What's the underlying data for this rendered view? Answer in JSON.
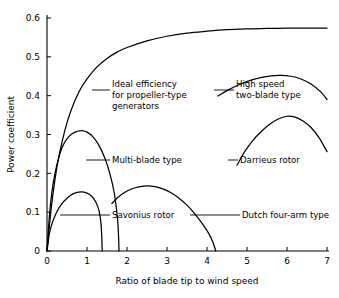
{
  "chart_data": {
    "type": "line",
    "title": "",
    "xlabel": "Ratio of blade tip to wind speed",
    "ylabel": "Power coefficient",
    "xlim": [
      0,
      7
    ],
    "ylim": [
      0,
      0.6
    ],
    "xticks": [
      "0",
      "1",
      "2",
      "3",
      "4",
      "5",
      "6",
      "7"
    ],
    "yticks": [
      "0",
      "0.1",
      "0.2",
      "0.3",
      "0.4",
      "0.5",
      "0.6"
    ],
    "grid": false,
    "legend_position": "inline-annotations",
    "line_color": "#000000",
    "background_color": "#ffffff",
    "series": [
      {
        "name": "Ideal efficiency for propeller-type generators",
        "peak_value": 0.593,
        "points": [
          [
            0.0,
            0.0
          ],
          [
            0.1,
            0.105
          ],
          [
            0.2,
            0.185
          ],
          [
            0.3,
            0.245
          ],
          [
            0.45,
            0.312
          ],
          [
            0.6,
            0.362
          ],
          [
            0.8,
            0.41
          ],
          [
            1.0,
            0.443
          ],
          [
            1.25,
            0.474
          ],
          [
            1.5,
            0.496
          ],
          [
            1.75,
            0.512
          ],
          [
            2.0,
            0.524
          ],
          [
            2.5,
            0.541
          ],
          [
            3.0,
            0.553
          ],
          [
            3.5,
            0.561
          ],
          [
            4.0,
            0.566
          ],
          [
            4.5,
            0.57
          ],
          [
            5.0,
            0.572
          ],
          [
            5.5,
            0.573
          ],
          [
            6.0,
            0.574
          ],
          [
            6.5,
            0.574
          ],
          [
            7.0,
            0.574
          ]
        ]
      },
      {
        "name": "Multi-blade type",
        "peak_value": 0.31,
        "peak_x": 0.87,
        "points": [
          [
            0.0,
            0.0
          ],
          [
            0.06,
            0.09
          ],
          [
            0.12,
            0.15
          ],
          [
            0.2,
            0.2
          ],
          [
            0.3,
            0.243
          ],
          [
            0.4,
            0.272
          ],
          [
            0.55,
            0.295
          ],
          [
            0.7,
            0.306
          ],
          [
            0.87,
            0.31
          ],
          [
            1.0,
            0.306
          ],
          [
            1.15,
            0.294
          ],
          [
            1.3,
            0.272
          ],
          [
            1.45,
            0.238
          ],
          [
            1.58,
            0.196
          ],
          [
            1.68,
            0.15
          ],
          [
            1.74,
            0.105
          ],
          [
            1.78,
            0.06
          ],
          [
            1.8,
            0.0
          ]
        ]
      },
      {
        "name": "Savonius rotor",
        "peak_value": 0.152,
        "peak_x": 0.85,
        "points": [
          [
            0.0,
            0.0
          ],
          [
            0.06,
            0.045
          ],
          [
            0.14,
            0.075
          ],
          [
            0.24,
            0.1
          ],
          [
            0.36,
            0.12
          ],
          [
            0.5,
            0.136
          ],
          [
            0.65,
            0.147
          ],
          [
            0.85,
            0.152
          ],
          [
            1.0,
            0.149
          ],
          [
            1.12,
            0.141
          ],
          [
            1.22,
            0.126
          ],
          [
            1.3,
            0.104
          ],
          [
            1.35,
            0.07
          ],
          [
            1.37,
            0.035
          ],
          [
            1.38,
            0.0
          ]
        ]
      },
      {
        "name": "Dutch four-arm type",
        "peak_value": 0.168,
        "peak_x": 2.5,
        "points": [
          [
            1.62,
            0.122
          ],
          [
            1.75,
            0.136
          ],
          [
            1.9,
            0.148
          ],
          [
            2.1,
            0.159
          ],
          [
            2.3,
            0.165
          ],
          [
            2.5,
            0.168
          ],
          [
            2.7,
            0.166
          ],
          [
            2.9,
            0.16
          ],
          [
            3.1,
            0.15
          ],
          [
            3.3,
            0.136
          ],
          [
            3.5,
            0.118
          ],
          [
            3.7,
            0.095
          ],
          [
            3.9,
            0.068
          ],
          [
            4.05,
            0.044
          ],
          [
            4.15,
            0.022
          ],
          [
            4.22,
            0.0
          ]
        ]
      },
      {
        "name": "High speed two-blade type",
        "peak_value": 0.452,
        "peak_x": 5.8,
        "points": [
          [
            4.27,
            0.399
          ],
          [
            4.5,
            0.413
          ],
          [
            4.8,
            0.428
          ],
          [
            5.1,
            0.44
          ],
          [
            5.4,
            0.448
          ],
          [
            5.8,
            0.452
          ],
          [
            6.1,
            0.45
          ],
          [
            6.35,
            0.443
          ],
          [
            6.6,
            0.43
          ],
          [
            6.85,
            0.409
          ],
          [
            7.0,
            0.39
          ]
        ]
      },
      {
        "name": "Darrieus rotor",
        "peak_value": 0.347,
        "peak_x": 6.0,
        "points": [
          [
            4.75,
            0.221
          ],
          [
            4.95,
            0.257
          ],
          [
            5.15,
            0.285
          ],
          [
            5.35,
            0.307
          ],
          [
            5.55,
            0.325
          ],
          [
            5.78,
            0.34
          ],
          [
            6.0,
            0.347
          ],
          [
            6.2,
            0.345
          ],
          [
            6.4,
            0.335
          ],
          [
            6.6,
            0.318
          ],
          [
            6.8,
            0.292
          ],
          [
            7.0,
            0.256
          ]
        ]
      }
    ],
    "annotations": [
      {
        "id": "ideal-efficiency",
        "lines": [
          "Ideal efficiency",
          "for propeller-type",
          "generators"
        ],
        "text_x": 112,
        "text_y": 87,
        "leader": {
          "x1": 92,
          "y1": 90,
          "x2": 110,
          "y2": 90
        }
      },
      {
        "id": "high-speed-two-blade",
        "lines": [
          "High speed",
          "two-blade type"
        ],
        "text_x": 236,
        "text_y": 87,
        "leader": {
          "x1": 214,
          "y1": 90,
          "x2": 234,
          "y2": 90
        }
      },
      {
        "id": "multi-blade",
        "lines": [
          "Multi-blade type"
        ],
        "text_x": 112,
        "text_y": 163,
        "leader": {
          "x1": 86,
          "y1": 160,
          "x2": 110,
          "y2": 160
        }
      },
      {
        "id": "darrieus-rotor",
        "lines": [
          "Darrieus rotor"
        ],
        "text_x": 240,
        "text_y": 163,
        "leader": {
          "x1": 228,
          "y1": 160,
          "x2": 238,
          "y2": 160
        }
      },
      {
        "id": "savonius-rotor",
        "lines": [
          "Savonius rotor"
        ],
        "text_x": 112,
        "text_y": 218,
        "leader": {
          "x1": 60,
          "y1": 215,
          "x2": 110,
          "y2": 215
        }
      },
      {
        "id": "dutch-four-arm",
        "lines": [
          "Dutch four-arm type"
        ],
        "text_x": 242,
        "text_y": 218,
        "leader": {
          "x1": 190,
          "y1": 215,
          "x2": 240,
          "y2": 215
        }
      }
    ]
  }
}
